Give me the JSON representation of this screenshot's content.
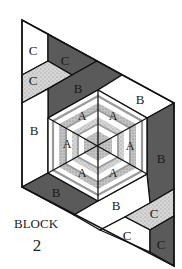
{
  "title": "BLOCK",
  "block_number": "2",
  "colors": {
    "white": "#ffffff",
    "dark": "#5a5a5a",
    "textured": "#c8c8c8",
    "outline": "#111111"
  },
  "pieces": {
    "c_top_white": "C",
    "c_top_dark": "C",
    "c_top_textured": "C",
    "b_top_dark": "B",
    "b_top_white": "B",
    "b_left_white": "B",
    "b_right_dark": "B",
    "b_bottom_dark": "B",
    "b_bottom_white": "B",
    "c_bottom_textured": "C",
    "c_bottom_white": "C",
    "c_bottom_dark": "C"
  },
  "hexagon": {
    "segments": [
      "A",
      "A",
      "A",
      "A",
      "A",
      "A"
    ]
  }
}
